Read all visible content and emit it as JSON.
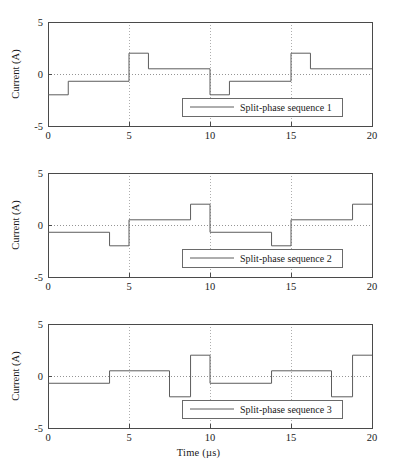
{
  "figure": {
    "panel_count": 3,
    "line_color": "#5d5d5d",
    "frame_color": "#4a4a4a",
    "grid_color": "#9a9a9a",
    "background": "#ffffff"
  },
  "axis": {
    "xlabel": "Time (µs)",
    "ylabel": "Current (A)",
    "xticks": [
      "0",
      "5",
      "10",
      "15",
      "20"
    ],
    "yticks": [
      "5",
      "0",
      "-5"
    ]
  },
  "chart_data": [
    {
      "type": "line",
      "title": "",
      "xlabel": "",
      "ylabel": "Current (A)",
      "xlim": [
        0,
        20
      ],
      "ylim": [
        -5,
        5
      ],
      "xticks": [
        0,
        5,
        10,
        15,
        20
      ],
      "yticks": [
        -5,
        0,
        5
      ],
      "grid": "vertical dotted at x=5,10,15 plus dotted zero line at y=0",
      "legend": {
        "entries": [
          "Split-phase sequence 1"
        ],
        "position": "lower center-right"
      },
      "series": [
        {
          "name": "Split-phase sequence 1",
          "style": "step-post",
          "steps": [
            {
              "x_start": 0.0,
              "x_end": 1.25,
              "y": -2.0
            },
            {
              "x_start": 1.25,
              "x_end": 5.0,
              "y": -0.7
            },
            {
              "x_start": 5.0,
              "x_end": 6.2,
              "y": 2.0
            },
            {
              "x_start": 6.2,
              "x_end": 10.0,
              "y": 0.5
            },
            {
              "x_start": 10.0,
              "x_end": 11.2,
              "y": -2.0
            },
            {
              "x_start": 11.2,
              "x_end": 15.0,
              "y": -0.7
            },
            {
              "x_start": 15.0,
              "x_end": 16.2,
              "y": 2.0
            },
            {
              "x_start": 16.2,
              "x_end": 20.0,
              "y": 0.5
            }
          ]
        }
      ]
    },
    {
      "type": "line",
      "title": "",
      "xlabel": "",
      "ylabel": "Current (A)",
      "xlim": [
        0,
        20
      ],
      "ylim": [
        -5,
        5
      ],
      "xticks": [
        0,
        5,
        10,
        15,
        20
      ],
      "yticks": [
        -5,
        0,
        5
      ],
      "grid": "vertical dotted at x=5,10,15 plus dotted zero line at y=0",
      "legend": {
        "entries": [
          "Split-phase sequence 2"
        ],
        "position": "lower center-right"
      },
      "series": [
        {
          "name": "Split-phase sequence 2",
          "style": "step-post",
          "steps": [
            {
              "x_start": 0.0,
              "x_end": 3.8,
              "y": -0.7
            },
            {
              "x_start": 3.8,
              "x_end": 5.0,
              "y": -2.0
            },
            {
              "x_start": 5.0,
              "x_end": 8.8,
              "y": 0.5
            },
            {
              "x_start": 8.8,
              "x_end": 10.0,
              "y": 2.0
            },
            {
              "x_start": 10.0,
              "x_end": 13.8,
              "y": -0.7
            },
            {
              "x_start": 13.8,
              "x_end": 15.0,
              "y": -2.0
            },
            {
              "x_start": 15.0,
              "x_end": 18.8,
              "y": 0.5
            },
            {
              "x_start": 18.8,
              "x_end": 20.0,
              "y": 2.0
            }
          ]
        }
      ]
    },
    {
      "type": "line",
      "title": "",
      "xlabel": "Time (µs)",
      "ylabel": "Current (A)",
      "xlim": [
        0,
        20
      ],
      "ylim": [
        -5,
        5
      ],
      "xticks": [
        0,
        5,
        10,
        15,
        20
      ],
      "yticks": [
        -5,
        0,
        5
      ],
      "grid": "vertical dotted at x=5,10,15 plus dotted zero line at y=0",
      "legend": {
        "entries": [
          "Split-phase sequence 3"
        ],
        "position": "lower center-right"
      },
      "series": [
        {
          "name": "Split-phase sequence 3",
          "style": "step-post",
          "steps": [
            {
              "x_start": 0.0,
              "x_end": 3.8,
              "y": -0.7
            },
            {
              "x_start": 3.8,
              "x_end": 7.5,
              "y": 0.5
            },
            {
              "x_start": 7.5,
              "x_end": 8.8,
              "y": -2.0
            },
            {
              "x_start": 8.8,
              "x_end": 10.0,
              "y": 2.0
            },
            {
              "x_start": 10.0,
              "x_end": 13.8,
              "y": -0.7
            },
            {
              "x_start": 13.8,
              "x_end": 17.5,
              "y": 0.5
            },
            {
              "x_start": 17.5,
              "x_end": 18.8,
              "y": -2.0
            },
            {
              "x_start": 18.8,
              "x_end": 20.0,
              "y": 2.0
            }
          ]
        }
      ]
    }
  ]
}
